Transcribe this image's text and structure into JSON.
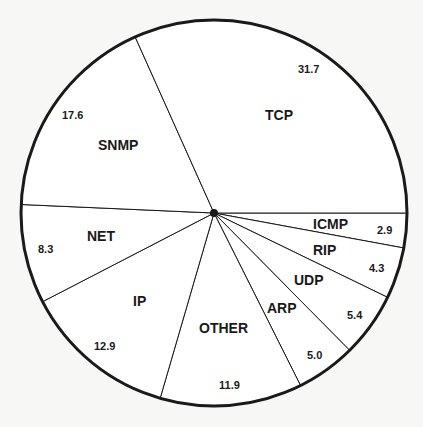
{
  "chart_data": {
    "type": "pie",
    "title": "",
    "unit": "percent",
    "start_angle_deg": 0,
    "direction": "clockwise",
    "slices": [
      {
        "label": "ICMP",
        "value": 2.9
      },
      {
        "label": "RIP",
        "value": 4.3
      },
      {
        "label": "UDP",
        "value": 5.4
      },
      {
        "label": "ARP",
        "value": 5.0
      },
      {
        "label": "OTHER",
        "value": 11.9
      },
      {
        "label": "IP",
        "value": 12.9
      },
      {
        "label": "NET",
        "value": 8.3
      },
      {
        "label": "SNMP",
        "value": 17.6
      },
      {
        "label": "TCP",
        "value": 31.7
      }
    ],
    "legend": "none",
    "fill_color": "#ffffff",
    "line_color": "#1a1a1a"
  },
  "labels": {
    "icmp": {
      "name": "ICMP",
      "value": "2.9"
    },
    "rip": {
      "name": "RIP",
      "value": "4.3"
    },
    "udp": {
      "name": "UDP",
      "value": "5.4"
    },
    "arp": {
      "name": "ARP",
      "value": "5.0"
    },
    "other": {
      "name": "OTHER",
      "value": "11.9"
    },
    "ip": {
      "name": "IP",
      "value": "12.9"
    },
    "net": {
      "name": "NET",
      "value": "8.3"
    },
    "snmp": {
      "name": "SNMP",
      "value": "17.6"
    },
    "tcp": {
      "name": "TCP",
      "value": "31.7"
    }
  }
}
